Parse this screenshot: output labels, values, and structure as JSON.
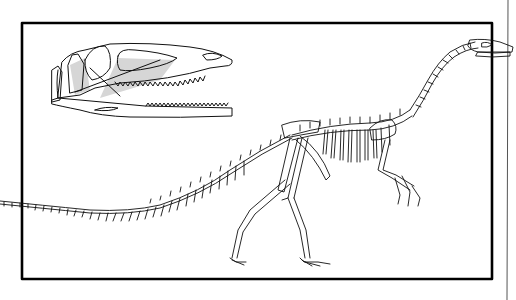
{
  "figure": {
    "style": "black line-art illustration on white",
    "colors": {
      "background": "#ffffff",
      "line": "#111111",
      "frame": "#000000",
      "shading": "#d6d6d6"
    },
    "elements": {
      "frame": "rectangular border",
      "right_rule": "thin vertical page line",
      "skull_inset": "lateral view of skull with open jaws and serrated teeth",
      "skeleton": "full skeleton in walking pose, long neck raised, long tail extending left beyond frame"
    }
  }
}
